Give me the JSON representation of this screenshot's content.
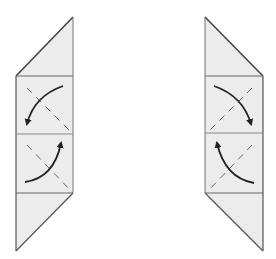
{
  "diagram": {
    "type": "origami-fold-steps",
    "colors": {
      "background": "#ffffff",
      "paper_fill": "#ececec",
      "edge": "#555555",
      "arrow": "#222222",
      "valley_line": "#555555"
    },
    "figures": [
      {
        "id": "left-figure",
        "outline": "parallelogram strip with triangle top pointing up-right and triangle bottom pointing down-left",
        "sections": [
          "top-triangle",
          "upper-square",
          "lower-square",
          "bottom-triangle"
        ],
        "upper_square": {
          "fold_line": "dashed diagonal top-left to bottom-right",
          "arrow": "curved, clockwise from top-right to bottom-left"
        },
        "lower_square": {
          "fold_line": "dashed diagonal top-left to bottom-right",
          "arrow": "curved from bottom-left to top-right"
        }
      },
      {
        "id": "right-figure",
        "outline": "parallelogram strip with triangle top pointing up-left and triangle bottom pointing down-right",
        "sections": [
          "top-triangle",
          "upper-square",
          "lower-square",
          "bottom-triangle"
        ],
        "upper_square": {
          "fold_line": "dashed diagonal top-right to bottom-left",
          "arrow": "curved from top-left to bottom-right"
        },
        "lower_square": {
          "fold_line": "dashed diagonal top-right to bottom-left",
          "arrow": "curved from bottom-right to top-left"
        }
      }
    ]
  }
}
